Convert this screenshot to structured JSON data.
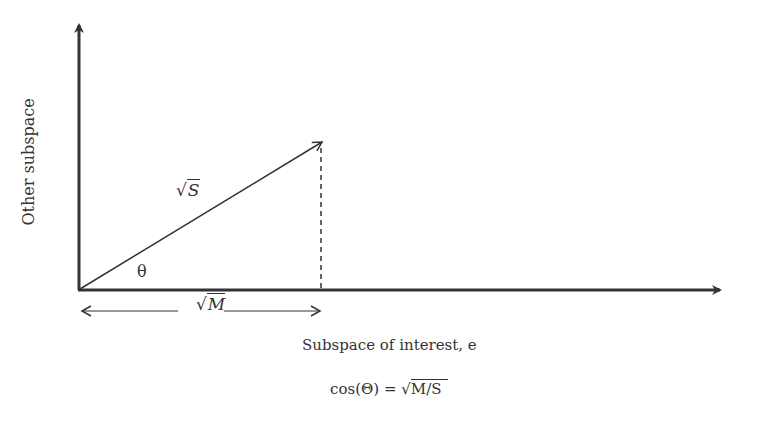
{
  "diagram": {
    "y_axis_label": "Other subspace",
    "x_axis_label": "Subspace of interest, e",
    "angle_label": "θ",
    "vector_label": {
      "radical": "√",
      "var": "S"
    },
    "projection_label": {
      "radical": "√",
      "var": "M"
    },
    "formula": {
      "lhs": "cos(Θ) = ",
      "radical": "√",
      "rhs": "M/S"
    },
    "colors": {
      "stroke": "#333333",
      "background": "#ffffff"
    }
  }
}
